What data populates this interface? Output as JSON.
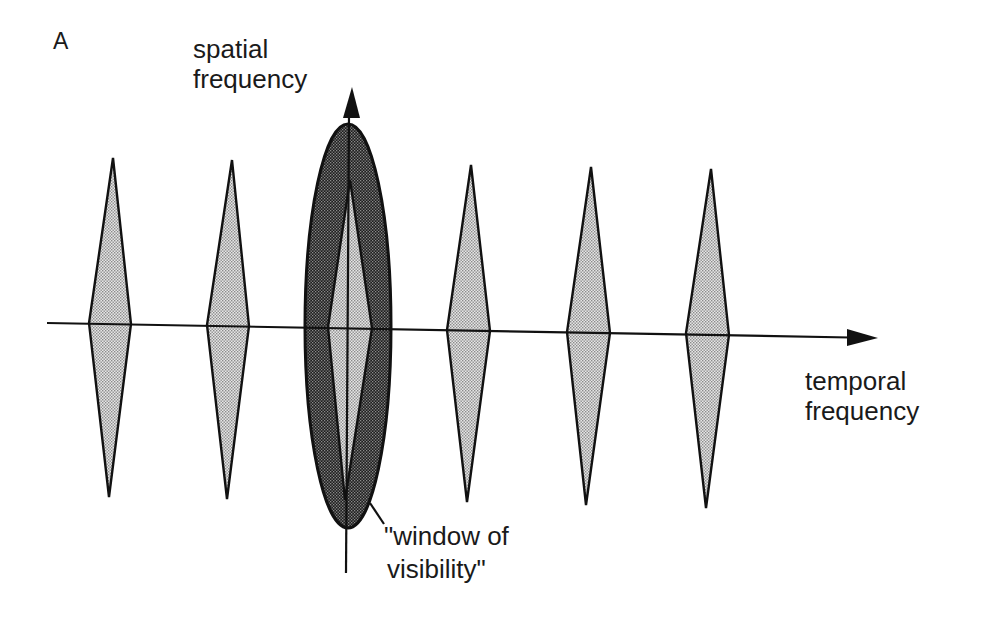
{
  "panel_label": "A",
  "y_axis": {
    "label_line1": "spatial",
    "label_line2": "frequency",
    "x": 349,
    "y_top": 87,
    "y_bottom": 573
  },
  "x_axis": {
    "label_line1": "temporal",
    "label_line2": "frequency",
    "x_start": 47,
    "y_start": 323,
    "x_end": 878,
    "y_end": 338
  },
  "window": {
    "label_line1": "\"window of",
    "label_line2": "visibility\"",
    "cx": 348,
    "cy": 326,
    "rx": 43,
    "ry": 202,
    "leader": [
      370,
      503,
      384,
      524
    ]
  },
  "diamonds": [
    {
      "top": [
        113,
        158
      ],
      "left": [
        89,
        323
      ],
      "right": [
        131,
        324
      ],
      "bottom": [
        109,
        497
      ]
    },
    {
      "top": [
        232,
        160
      ],
      "left": [
        207,
        325
      ],
      "right": [
        249,
        326
      ],
      "bottom": [
        227,
        499
      ]
    },
    {
      "top": [
        350,
        180
      ],
      "left": [
        328,
        327
      ],
      "right": [
        372,
        328
      ],
      "bottom": [
        345,
        500
      ]
    },
    {
      "top": [
        471,
        165
      ],
      "left": [
        447,
        330
      ],
      "right": [
        490,
        331
      ],
      "bottom": [
        467,
        502
      ]
    },
    {
      "top": [
        591,
        167
      ],
      "left": [
        567,
        332
      ],
      "right": [
        610,
        333
      ],
      "bottom": [
        586,
        505
      ]
    },
    {
      "top": [
        711,
        169
      ],
      "left": [
        686,
        333
      ],
      "right": [
        729,
        335
      ],
      "bottom": [
        706,
        508
      ]
    }
  ],
  "colors": {
    "ink": "#1a1a1a",
    "light_fill": "#cfcfcf",
    "dark_fill": "#3a3a3a"
  }
}
